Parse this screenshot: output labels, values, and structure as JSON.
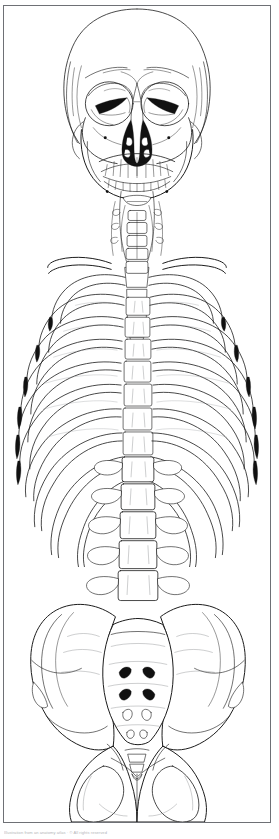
{
  "figure": {
    "view": "anterior",
    "style": "black-and-white line drawing",
    "caption": "Illustration from an anatomy atlas · © All rights reserved",
    "frame": {
      "border_color": "#6e7075",
      "background": "#ffffff",
      "line_color": "#1a1a1a"
    },
    "regions": [
      {
        "id": "skull",
        "label": "Skull (cranium and mandible)"
      },
      {
        "id": "cervical-spine",
        "label": "Cervical spine and hyoid"
      },
      {
        "id": "thoracic-cage",
        "label": "Thoracic cage (ribs and sternum)"
      },
      {
        "id": "lumbar-spine",
        "label": "Lumbar vertebrae"
      },
      {
        "id": "pelvis",
        "label": "Pelvis, sacrum and coccyx"
      }
    ],
    "structures": [
      {
        "id": "cranial-vault",
        "label": "Cranial vault"
      },
      {
        "id": "orbit-left",
        "label": "Left orbit"
      },
      {
        "id": "orbit-right",
        "label": "Right orbit"
      },
      {
        "id": "nasal-aperture",
        "label": "Piriform nasal aperture"
      },
      {
        "id": "maxilla",
        "label": "Maxilla with upper teeth"
      },
      {
        "id": "mandible",
        "label": "Mandible with lower teeth"
      },
      {
        "id": "zygomatic-arch",
        "label": "Zygomatic arch"
      },
      {
        "id": "hyoid",
        "label": "Hyoid bone"
      },
      {
        "id": "clavicle",
        "label": "Clavicle"
      },
      {
        "id": "sternum",
        "label": "Sternum"
      },
      {
        "id": "ribs",
        "label": "Ribs"
      },
      {
        "id": "vertebral-bodies",
        "label": "Vertebral bodies"
      },
      {
        "id": "transverse-process",
        "label": "Transverse processes"
      },
      {
        "id": "ilium",
        "label": "Ilium"
      },
      {
        "id": "sacrum",
        "label": "Sacrum"
      },
      {
        "id": "sacral-foramina",
        "label": "Anterior sacral foramina"
      },
      {
        "id": "coccyx",
        "label": "Coccyx"
      },
      {
        "id": "obturator-foramen",
        "label": "Obturator foramen"
      },
      {
        "id": "pubic-symphysis",
        "label": "Pubic symphysis"
      },
      {
        "id": "ischium",
        "label": "Ischium"
      }
    ]
  }
}
